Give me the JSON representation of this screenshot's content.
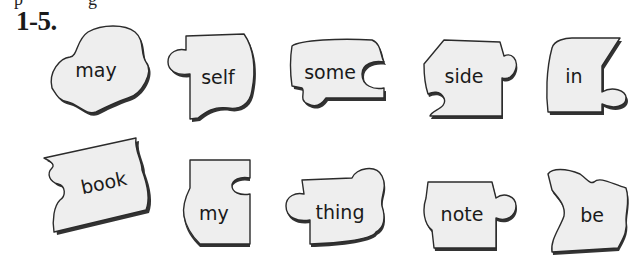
{
  "cropped_previous_line": [
    "p",
    "g"
  ],
  "exercise": {
    "label": "1-5."
  },
  "puzzle_pieces": [
    {
      "word": "may"
    },
    {
      "word": "self"
    },
    {
      "word": "some"
    },
    {
      "word": "side"
    },
    {
      "word": "in"
    },
    {
      "word": "book"
    },
    {
      "word": "my"
    },
    {
      "word": "thing"
    },
    {
      "word": "note"
    },
    {
      "word": "be"
    }
  ],
  "colors": {
    "piece_fill": "#eeeeee",
    "piece_outline": "#2b2b2b",
    "shadow": "#333333",
    "text": "#1a1a1a"
  }
}
